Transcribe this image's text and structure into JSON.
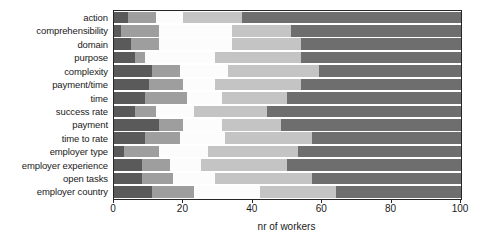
{
  "chart_data": {
    "type": "bar",
    "orientation": "horizontal",
    "stacked": true,
    "stack_mode": "percent",
    "title": "",
    "xlabel": "nr of workers",
    "ylabel": "",
    "xlim": [
      0,
      100
    ],
    "xticks": [
      0,
      20,
      40,
      60,
      80,
      100
    ],
    "xticklabels": [
      "0",
      "20",
      "40",
      "60",
      "80",
      "100"
    ],
    "grid": false,
    "legend": "none",
    "categories": [
      "action",
      "comprehensibility",
      "domain",
      "purpose",
      "complexity",
      "payment/time",
      "time",
      "success rate",
      "payment",
      "time to rate",
      "employer type",
      "employer experience",
      "open tasks",
      "employer country"
    ],
    "series": [
      {
        "name": "segment-1",
        "color": "#5a5a5a",
        "values": [
          4,
          2,
          5,
          6,
          11,
          10,
          9,
          6,
          13,
          9,
          3,
          8,
          8,
          11
        ]
      },
      {
        "name": "segment-2",
        "color": "#9e9e9e",
        "values": [
          8,
          11,
          8,
          3,
          8,
          10,
          12,
          6,
          7,
          10,
          10,
          8,
          9,
          12
        ]
      },
      {
        "name": "segment-3",
        "color": "#fcfcfc",
        "values": [
          8,
          21,
          21,
          20,
          14,
          9,
          10,
          11,
          11,
          13,
          14,
          9,
          12,
          19
        ]
      },
      {
        "name": "segment-4",
        "color": "#c4c4c4",
        "values": [
          17,
          17,
          20,
          25,
          26,
          25,
          19,
          21,
          17,
          25,
          26,
          25,
          28,
          22
        ]
      },
      {
        "name": "segment-5",
        "color": "#6e6e6e",
        "values": [
          63,
          49,
          46,
          46,
          41,
          46,
          50,
          56,
          52,
          43,
          47,
          50,
          43,
          36
        ]
      }
    ],
    "cumulative_boundaries": [
      [
        4,
        12,
        20,
        37,
        100
      ],
      [
        2,
        13,
        34,
        51,
        100
      ],
      [
        5,
        13,
        34,
        54,
        100
      ],
      [
        6,
        9,
        29,
        54,
        100
      ],
      [
        11,
        19,
        33,
        59,
        100
      ],
      [
        10,
        20,
        29,
        54,
        100
      ],
      [
        9,
        21,
        31,
        50,
        100
      ],
      [
        6,
        12,
        23,
        44,
        100
      ],
      [
        13,
        20,
        31,
        48,
        100
      ],
      [
        9,
        19,
        32,
        57,
        100
      ],
      [
        3,
        13,
        27,
        53,
        100
      ],
      [
        8,
        16,
        25,
        50,
        100
      ],
      [
        8,
        17,
        29,
        57,
        100
      ],
      [
        11,
        23,
        42,
        64,
        100
      ]
    ]
  },
  "style": {
    "axis_color": "#262626",
    "text_color": "#1a1a1a",
    "background": "#ffffff"
  }
}
